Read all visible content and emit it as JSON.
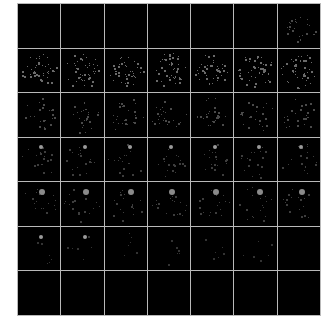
{
  "figure": {
    "type": "image-montage",
    "rows": 7,
    "cols": 7,
    "background": "#000000",
    "grid_line_color": "#b9b9b9",
    "side_labels": [
      "",
      "",
      "",
      "",
      "",
      "",
      ""
    ],
    "tiles": [
      [
        "empty",
        "empty",
        "empty",
        "empty",
        "empty",
        "empty",
        "faint-cluster"
      ],
      [
        "cell-cluster",
        "cell-cluster",
        "cell-cluster",
        "cell-cluster",
        "cell-cluster",
        "cell-cluster",
        "cell-cluster"
      ],
      [
        "faint-cluster",
        "faint-cluster",
        "faint-cluster",
        "faint-cluster",
        "faint-cluster",
        "faint-cluster",
        "faint-cluster"
      ],
      [
        "spot-cluster",
        "spot-cluster",
        "spot-cluster",
        "spot-cluster",
        "spot-cluster",
        "spot-cluster",
        "spot-cluster"
      ],
      [
        "spot-cluster",
        "spot-cluster",
        "spot-cluster",
        "spot-cluster",
        "spot-cluster",
        "spot-cluster",
        "spot-cluster"
      ],
      [
        "spot",
        "spot",
        "faint",
        "faint",
        "faint",
        "faint",
        "empty"
      ],
      [
        "empty",
        "empty",
        "empty",
        "empty",
        "empty",
        "empty",
        "empty"
      ]
    ]
  }
}
